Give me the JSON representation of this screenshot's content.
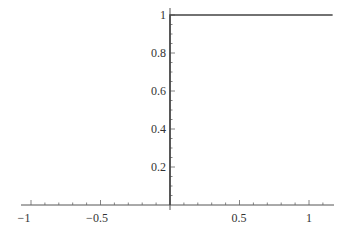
{
  "chart_data": {
    "type": "line",
    "title": "",
    "xlabel": "",
    "ylabel": "",
    "xlim": [
      -1.1,
      1.18
    ],
    "ylim": [
      0,
      1.02
    ],
    "grid": false,
    "legend": null,
    "x_ticks": [
      {
        "value": -1,
        "label": "−1"
      },
      {
        "value": -0.5,
        "label": "−0.5"
      },
      {
        "value": 0.5,
        "label": "0.5"
      },
      {
        "value": 1,
        "label": "1"
      }
    ],
    "y_ticks": [
      {
        "value": 0.2,
        "label": "0.2"
      },
      {
        "value": 0.4,
        "label": "0.4"
      },
      {
        "value": 0.6,
        "label": "0.6"
      },
      {
        "value": 0.8,
        "label": "0.8"
      },
      {
        "value": 1,
        "label": "1"
      }
    ],
    "series": [
      {
        "name": "step",
        "description": "Vertical line at x=0 from y=0 to y=1, then horizontal at y=1 for x>0",
        "x": [
          0,
          0,
          1.17
        ],
        "y": [
          0,
          1,
          1
        ]
      }
    ]
  },
  "colors": {
    "axis": "#555555",
    "curve": "#444444",
    "background": "#ffffff"
  }
}
